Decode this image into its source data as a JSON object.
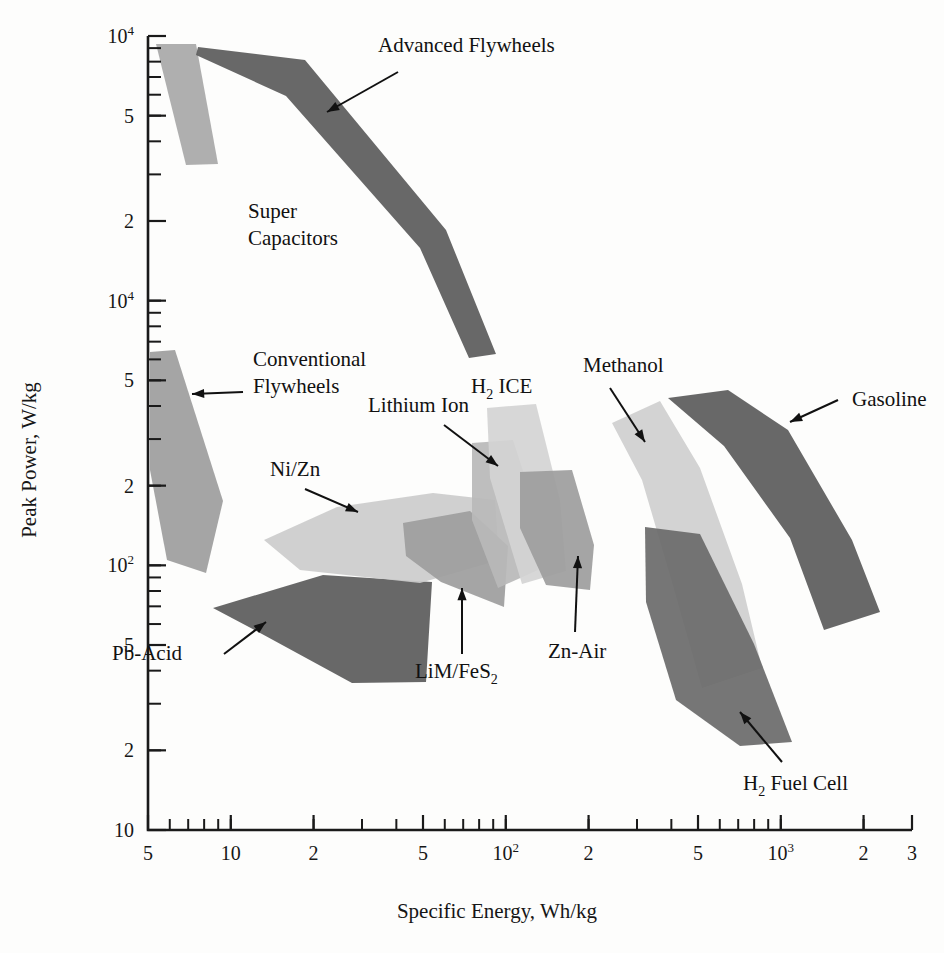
{
  "chart_data": {
    "type": "area",
    "title": "",
    "xlabel": "Specific Energy, Wh/kg",
    "ylabel": "Peak Power, W/kg",
    "xscale": "log",
    "yscale": "log",
    "xlim": [
      5,
      3000
    ],
    "ylim": [
      10,
      10000
    ],
    "grid": false,
    "legend_position": "none",
    "x_tick_labels": [
      "5",
      "10",
      "2",
      "5",
      "10",
      "2",
      "5",
      "10",
      "2",
      "3"
    ],
    "x_tick_sups": [
      "",
      "",
      "",
      "",
      "2",
      "",
      "",
      "3",
      "",
      ""
    ],
    "x_tick_values": [
      5,
      10,
      20,
      50,
      100,
      200,
      500,
      1000,
      2000,
      3000
    ],
    "y_tick_labels": [
      "10",
      "5",
      "2",
      "10",
      "5",
      "2",
      "10",
      "5",
      "2",
      "10"
    ],
    "y_tick_sups": [
      "4",
      "",
      "",
      "4",
      "",
      "",
      "2",
      "",
      "",
      ""
    ],
    "y_tick_values": [
      10000,
      5000,
      2000,
      1000,
      500,
      200,
      100,
      50,
      20,
      10
    ],
    "series": [
      {
        "name": "Super Capacitors",
        "color": "#a8a8a8",
        "label": "Super Capacitors",
        "label_lines": [
          "Super",
          "Capacitors"
        ],
        "label_x": 248,
        "label_y": 218,
        "leader": null,
        "points": "156,44 196,44 218,164 186,165"
      },
      {
        "name": "Advanced Flywheels",
        "color": "#5b5b5b",
        "label": "Advanced Flywheels",
        "label_lines": [
          "Advanced Flywheels"
        ],
        "label_x": 378,
        "label_y": 52,
        "leader": {
          "x1": 398,
          "y1": 72,
          "x2": 327,
          "y2": 112
        },
        "points": "198,47 305,60 446,230 496,354 469,358 420,248 286,96 196,55"
      },
      {
        "name": "Conventional Flywheels",
        "color": "#9d9d9d",
        "label": "Conventional Flywheels",
        "label_lines": [
          "Conventional",
          "Flywheels"
        ],
        "label_x": 253,
        "label_y": 366,
        "leader": {
          "x1": 243,
          "y1": 392,
          "x2": 192,
          "y2": 394
        },
        "points": "150,352 175,350 223,501 206,573 167,560 150,470"
      },
      {
        "name": "Pb-Acid",
        "color": "#5b5b5b",
        "label": "Pb-Acid",
        "label_lines": [
          "Pb-Acid"
        ],
        "label_x": 112,
        "label_y": 660,
        "leader": {
          "x1": 224,
          "y1": 654,
          "x2": 266,
          "y2": 622
        },
        "points": "213,608 323,575 432,582 426,682 352,683 262,634"
      },
      {
        "name": "Ni/Zn",
        "color": "#cccccc",
        "label": "Ni/Zn",
        "label_lines": [
          "Ni/Zn"
        ],
        "label_x": 270,
        "label_y": 476,
        "leader": {
          "x1": 305,
          "y1": 489,
          "x2": 358,
          "y2": 512
        },
        "points": "264,540 337,507 433,493 495,500 499,560 420,583 300,570"
      },
      {
        "name": "LiM/FeS2",
        "color": "#9d9d9d",
        "label": "LiM/FeS₂",
        "label_lines": [
          "LiM/FeS"
        ],
        "label_sub": "2",
        "label_x": 415,
        "label_y": 678,
        "leader": {
          "x1": 462,
          "y1": 654,
          "x2": 462,
          "y2": 588
        },
        "points": "403,523 470,511 508,546 504,607 441,582 406,556"
      },
      {
        "name": "Lithium Ion",
        "color": "#b8b8b8",
        "label": "Lithium Ion",
        "label_lines": [
          "Lithium Ion"
        ],
        "label_x": 368,
        "label_y": 412,
        "leader": {
          "x1": 444,
          "y1": 425,
          "x2": 498,
          "y2": 466
        },
        "points": "472,443 513,440 534,505 538,570 498,588 472,520"
      },
      {
        "name": "H2 ICE",
        "color": "#d4d4d4",
        "label": "H₂ ICE",
        "label_lines": [
          "H"
        ],
        "label_sub": "2",
        "label_tail": " ICE",
        "label_x": 471,
        "label_y": 393,
        "leader": null,
        "points": "487,408 536,404 560,500 566,571 522,584 490,478"
      },
      {
        "name": "Zn-Air",
        "color": "#9d9d9d",
        "label": "Zn-Air",
        "label_lines": [
          "Zn-Air"
        ],
        "label_x": 548,
        "label_y": 658,
        "leader": {
          "x1": 575,
          "y1": 632,
          "x2": 578,
          "y2": 556
        },
        "points": "520,472 572,470 594,545 590,590 546,585 520,528"
      },
      {
        "name": "Methanol",
        "color": "#cfcfcf",
        "label": "Methanol",
        "label_lines": [
          "Methanol"
        ],
        "label_x": 583,
        "label_y": 372,
        "leader": {
          "x1": 610,
          "y1": 388,
          "x2": 645,
          "y2": 442
        },
        "points": "612,423 660,401 700,468 742,584 762,668 702,688 672,582 642,480"
      },
      {
        "name": "H2 Fuel Cell",
        "color": "#6a6a6a",
        "label": "H₂ Fuel Cell",
        "label_lines": [
          "H"
        ],
        "label_sub": "2",
        "label_tail": " Fuel Cell",
        "label_x": 743,
        "label_y": 790,
        "leader": {
          "x1": 782,
          "y1": 762,
          "x2": 740,
          "y2": 712
        },
        "points": "645,527 700,534 754,644 792,742 740,746 676,700 646,602"
      },
      {
        "name": "Gasoline",
        "color": "#5b5b5b",
        "label": "Gasoline",
        "label_lines": [
          "Gasoline"
        ],
        "label_x": 852,
        "label_y": 406,
        "leader": {
          "x1": 838,
          "y1": 400,
          "x2": 790,
          "y2": 422
        },
        "points": "668,398 728,390 788,430 852,540 880,612 824,630 790,538 724,446"
      }
    ]
  },
  "axes": {
    "x_title": "Specific Energy, Wh/kg",
    "y_title": "Peak Power, W/kg"
  }
}
